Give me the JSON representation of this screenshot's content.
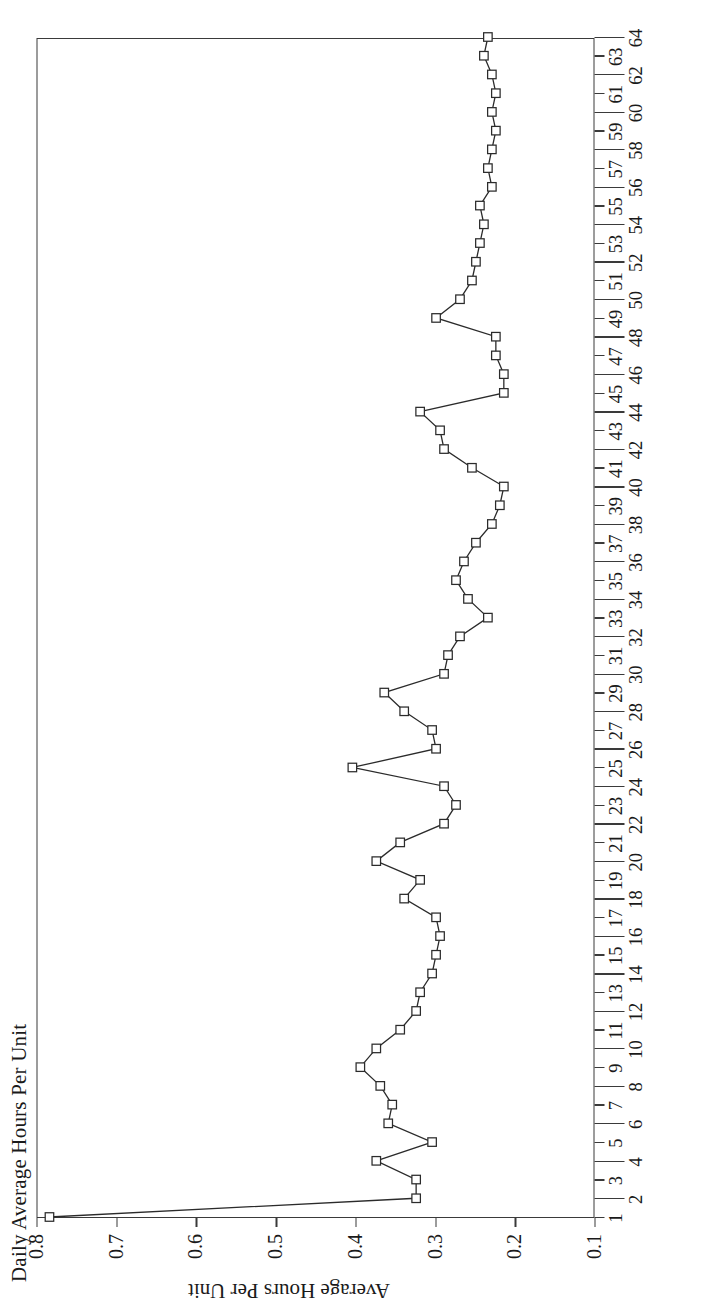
{
  "chart_data": {
    "type": "line",
    "title": "Daily Average Hours Per Unit",
    "xlabel": "",
    "ylabel": "Average Hours Per Unit",
    "xlim": [
      1,
      64
    ],
    "ylim": [
      0.1,
      0.8
    ],
    "grid": false,
    "legend": null,
    "marker": "open-square",
    "x_tick_labels": [
      "1",
      "2",
      "3",
      "4",
      "5",
      "6",
      "7",
      "8",
      "9",
      "10",
      "11",
      "12",
      "13",
      "14",
      "15",
      "16",
      "17",
      "18",
      "19",
      "20",
      "21",
      "22",
      "23",
      "24",
      "25",
      "26",
      "27",
      "28",
      "29",
      "30",
      "31",
      "32",
      "33",
      "34",
      "35",
      "36",
      "37",
      "38",
      "39",
      "40",
      "41",
      "42",
      "43",
      "44",
      "45",
      "46",
      "47",
      "48",
      "49",
      "50",
      "51",
      "52",
      "53",
      "54",
      "55",
      "56",
      "57",
      "58",
      "59",
      "60",
      "61",
      "62",
      "63",
      "64"
    ],
    "y_tick_labels": [
      "0.1",
      "0.2",
      "0.3",
      "0.4",
      "0.5",
      "0.6",
      "0.7",
      "0.8"
    ],
    "y_ticks": [
      0.1,
      0.2,
      0.3,
      0.4,
      0.5,
      0.6,
      0.7,
      0.8
    ],
    "x": [
      1,
      2,
      3,
      4,
      5,
      6,
      7,
      8,
      9,
      10,
      11,
      12,
      13,
      14,
      15,
      16,
      17,
      18,
      19,
      20,
      21,
      22,
      23,
      24,
      25,
      26,
      27,
      28,
      29,
      30,
      31,
      32,
      33,
      34,
      35,
      36,
      37,
      38,
      39,
      40,
      41,
      42,
      43,
      44,
      45,
      46,
      47,
      48,
      49,
      50,
      51,
      52,
      53,
      54,
      55,
      56,
      57,
      58,
      59,
      60,
      61,
      62,
      63,
      64
    ],
    "values": [
      0.785,
      0.325,
      0.325,
      0.375,
      0.305,
      0.36,
      0.355,
      0.37,
      0.395,
      0.375,
      0.345,
      0.325,
      0.32,
      0.305,
      0.3,
      0.295,
      0.3,
      0.34,
      0.32,
      0.375,
      0.345,
      0.29,
      0.275,
      0.29,
      0.405,
      0.3,
      0.305,
      0.34,
      0.365,
      0.29,
      0.285,
      0.27,
      0.235,
      0.26,
      0.275,
      0.265,
      0.25,
      0.23,
      0.22,
      0.215,
      0.255,
      0.29,
      0.295,
      0.32,
      0.215,
      0.215,
      0.225,
      0.225,
      0.3,
      0.27,
      0.255,
      0.25,
      0.245,
      0.24,
      0.245,
      0.23,
      0.235,
      0.23,
      0.225,
      0.23,
      0.225,
      0.23,
      0.24,
      0.235
    ]
  }
}
